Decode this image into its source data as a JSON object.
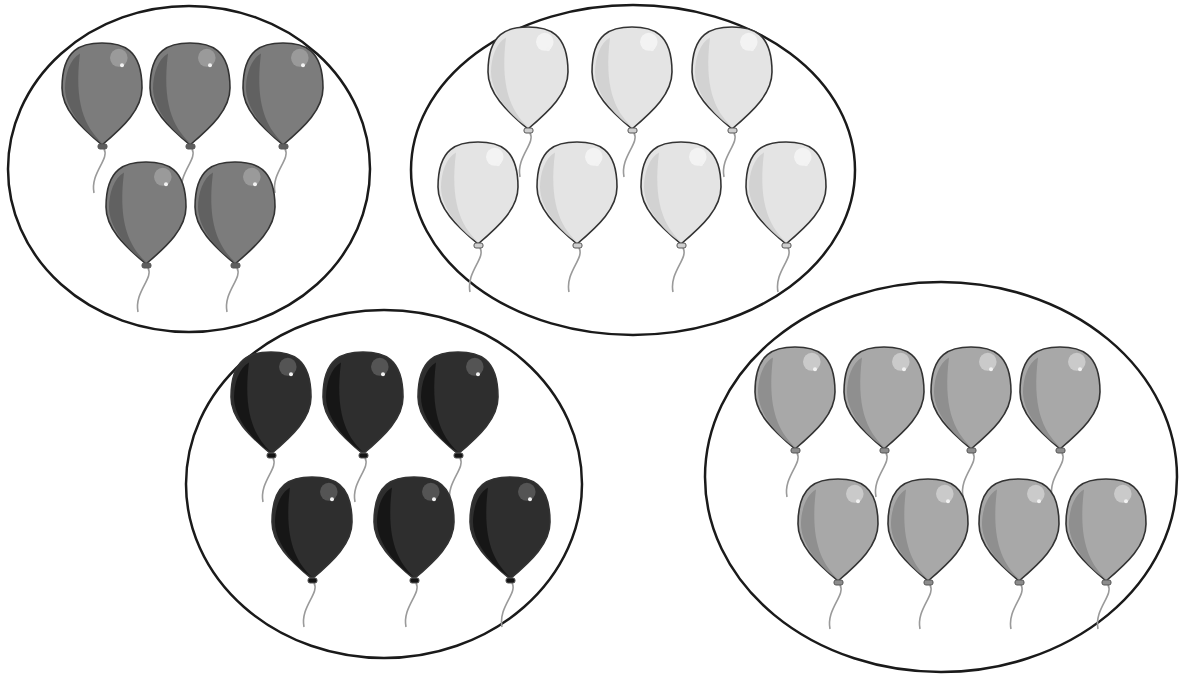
{
  "scene": {
    "title": "",
    "background": "#ffffff"
  },
  "groups": [
    {
      "name": "group-dark-gray",
      "count": 5,
      "color": "#7c7c7c",
      "shade": "#5e5e5e",
      "highlight": "#a0a0a0",
      "ellipse": {
        "cx": 189,
        "cy": 169,
        "rx": 181,
        "ry": 163
      },
      "balloons": [
        [
          102,
          96
        ],
        [
          190,
          96
        ],
        [
          283,
          96
        ],
        [
          146,
          215
        ],
        [
          235,
          215
        ]
      ]
    },
    {
      "name": "group-light-gray",
      "count": 7,
      "color": "#e4e4e4",
      "shade": "#cfcfcf",
      "highlight": "#f6f6f6",
      "ellipse": {
        "cx": 633,
        "cy": 170,
        "rx": 222,
        "ry": 165
      },
      "balloons": [
        [
          528,
          80
        ],
        [
          632,
          80
        ],
        [
          732,
          80
        ],
        [
          478,
          195
        ],
        [
          577,
          195
        ],
        [
          681,
          195
        ],
        [
          786,
          195
        ]
      ]
    },
    {
      "name": "group-black",
      "count": 6,
      "color": "#2e2e2e",
      "shade": "#141414",
      "highlight": "#5a5a5a",
      "ellipse": {
        "cx": 384,
        "cy": 484,
        "rx": 198,
        "ry": 174
      },
      "balloons": [
        [
          271,
          405
        ],
        [
          363,
          405
        ],
        [
          458,
          405
        ],
        [
          312,
          530
        ],
        [
          414,
          530
        ],
        [
          510,
          530
        ]
      ]
    },
    {
      "name": "group-medium-gray",
      "count": 8,
      "color": "#a8a8a8",
      "shade": "#8c8c8c",
      "highlight": "#d0d0d0",
      "ellipse": {
        "cx": 941,
        "cy": 477,
        "rx": 236,
        "ry": 195
      },
      "balloons": [
        [
          795,
          400
        ],
        [
          884,
          400
        ],
        [
          971,
          400
        ],
        [
          1060,
          400
        ],
        [
          838,
          532
        ],
        [
          928,
          532
        ],
        [
          1019,
          532
        ],
        [
          1106,
          532
        ]
      ]
    }
  ],
  "balloon_size": {
    "w": 80,
    "h": 106
  }
}
